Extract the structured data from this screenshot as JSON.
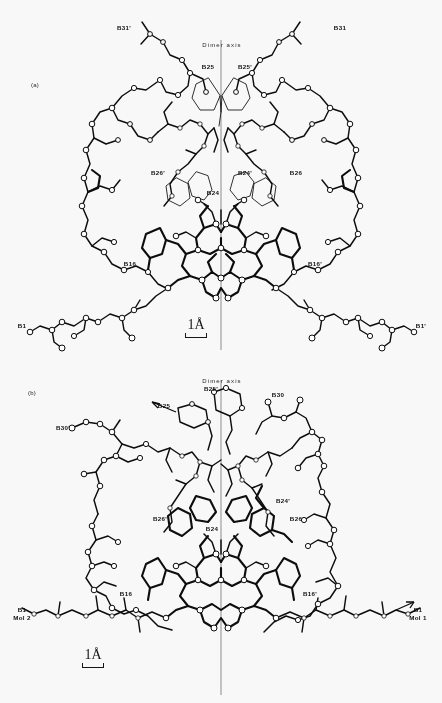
{
  "figure": {
    "type": "crystallographic-ball-and-stick-dimer",
    "background_color": "#f4f3f0",
    "ink_color": "#111111",
    "axis_color": "#8c8c8c"
  },
  "panels": [
    {
      "id": "a",
      "panel_label": "(a)",
      "axis_label": "Dimer axis",
      "scalebar": "1Å",
      "labels": [
        {
          "text": "B31'",
          "x": 124,
          "y": 27
        },
        {
          "text": "B31",
          "x": 340,
          "y": 27
        },
        {
          "text": "B25",
          "x": 208,
          "y": 66
        },
        {
          "text": "B25'",
          "x": 245,
          "y": 66
        },
        {
          "text": "B26'",
          "x": 158,
          "y": 172
        },
        {
          "text": "B24",
          "x": 213,
          "y": 192
        },
        {
          "text": "B24'",
          "x": 245,
          "y": 172
        },
        {
          "text": "B26",
          "x": 296,
          "y": 172
        },
        {
          "text": "B16",
          "x": 130,
          "y": 263
        },
        {
          "text": "B16'",
          "x": 315,
          "y": 263
        },
        {
          "text": "B1",
          "x": 22,
          "y": 325
        },
        {
          "text": "B1'",
          "x": 421,
          "y": 325
        }
      ]
    },
    {
      "id": "b",
      "panel_label": "(b)",
      "axis_label": "Dimer axis",
      "scalebar": "1Å",
      "labels": [
        {
          "text": "B25'",
          "x": 211,
          "y": 388
        },
        {
          "text": "B25",
          "x": 164,
          "y": 405
        },
        {
          "text": "B30",
          "x": 278,
          "y": 394
        },
        {
          "text": "B30'",
          "x": 63,
          "y": 427
        },
        {
          "text": "B24'",
          "x": 283,
          "y": 500
        },
        {
          "text": "B26",
          "x": 296,
          "y": 518
        },
        {
          "text": "B26'",
          "x": 160,
          "y": 518
        },
        {
          "text": "B24",
          "x": 212,
          "y": 528
        },
        {
          "text": "B16",
          "x": 126,
          "y": 593
        },
        {
          "text": "B16'",
          "x": 310,
          "y": 593
        },
        {
          "text": "B1",
          "x": 22,
          "y": 613,
          "line2": "Mol 2"
        },
        {
          "text": "B1",
          "x": 418,
          "y": 613,
          "line2": "Mol 1"
        }
      ]
    }
  ]
}
